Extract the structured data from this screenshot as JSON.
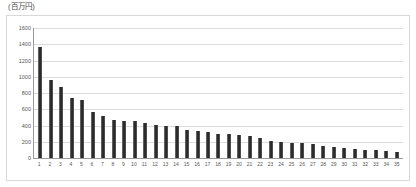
{
  "unit_caption": "(百万円)",
  "chart_data": {
    "type": "bar",
    "title": "",
    "subtitle": "",
    "xlabel": "",
    "ylabel": "(百万円)",
    "ylim": [
      0,
      1600
    ],
    "y_ticks": [
      1600,
      1400,
      1200,
      1000,
      800,
      600,
      400,
      200,
      0
    ],
    "grid": true,
    "legend": false,
    "legend_position": "none",
    "bar_color": "#2b2b2b",
    "categories": [
      "1",
      "2",
      "3",
      "4",
      "5",
      "6",
      "7",
      "8",
      "9",
      "10",
      "11",
      "12",
      "13",
      "14",
      "15",
      "16",
      "17",
      "18",
      "19",
      "20",
      "21",
      "22",
      "23",
      "24",
      "25",
      "26",
      "27",
      "28",
      "29",
      "30",
      "31",
      "32",
      "33",
      "34",
      "35"
    ],
    "values": [
      1370,
      960,
      870,
      740,
      710,
      570,
      520,
      470,
      460,
      450,
      430,
      410,
      400,
      390,
      340,
      330,
      320,
      300,
      290,
      280,
      270,
      250,
      210,
      200,
      190,
      180,
      170,
      150,
      140,
      120,
      110,
      100,
      95,
      85,
      80
    ],
    "series": [
      {
        "name": "金額",
        "values": [
          1370,
          960,
          870,
          740,
          710,
          570,
          520,
          470,
          460,
          450,
          430,
          410,
          400,
          390,
          340,
          330,
          320,
          300,
          290,
          280,
          270,
          250,
          210,
          200,
          190,
          180,
          170,
          150,
          140,
          120,
          110,
          100,
          95,
          85,
          80
        ]
      }
    ]
  }
}
